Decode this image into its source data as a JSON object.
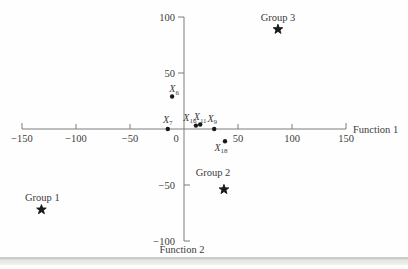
{
  "chart_data": {
    "type": "scatter",
    "title": "",
    "grid": false,
    "legend": "none",
    "x_axis": {
      "label": "Function 1",
      "range": [
        -150,
        150
      ],
      "ticks": [
        -150,
        -100,
        -50,
        0,
        50,
        100,
        150
      ],
      "tick_labels": [
        "−150",
        "−100",
        "−50",
        "0",
        "50",
        "100",
        "150"
      ]
    },
    "y_axis": {
      "label": "Function 2",
      "range": [
        -100,
        100
      ],
      "ticks": [
        100,
        50,
        -50,
        -100
      ],
      "tick_labels": [
        "100",
        "50",
        "−50",
        "−100"
      ]
    },
    "points": [
      {
        "id": "X6",
        "label_base": "X",
        "label_sub": "6",
        "x": -11,
        "y": 29,
        "label_offset": [
          2,
          -4.5
        ]
      },
      {
        "id": "X7",
        "label_base": "X",
        "label_sub": "7",
        "x": -15,
        "y": 0,
        "label_offset": [
          0,
          -6.5
        ]
      },
      {
        "id": "X16",
        "label_base": "X",
        "label_sub": "16",
        "x": 11,
        "y": 3,
        "label_offset": [
          -6,
          -5
        ]
      },
      {
        "id": "X11",
        "label_base": "X",
        "label_sub": "11",
        "x": 15,
        "y": 4,
        "label_offset": [
          0,
          -4.5
        ]
      },
      {
        "id": "X9",
        "label_base": "X",
        "label_sub": "9",
        "x": 28,
        "y": 0,
        "label_offset": [
          -2,
          -7.5
        ]
      },
      {
        "id": "X18",
        "label_base": "X",
        "label_sub": "18",
        "x": 38,
        "y": -11,
        "label_offset": [
          -4,
          9.5
        ]
      }
    ],
    "centroids": [
      {
        "id": "group-1",
        "label": "Group 1",
        "x": -132,
        "y": -72,
        "label_offset": [
          1,
          -9
        ]
      },
      {
        "id": "group-2",
        "label": "Group 2",
        "x": 37,
        "y": -54,
        "label_offset": [
          -11,
          -14
        ]
      },
      {
        "id": "group-3",
        "label": "Group 3",
        "x": 87,
        "y": 89,
        "label_offset": [
          0,
          -8.5
        ]
      }
    ],
    "colors": {
      "axis": "#7d7d7d",
      "text": "#3b3b3b",
      "marker": "#1a1a1a"
    }
  }
}
